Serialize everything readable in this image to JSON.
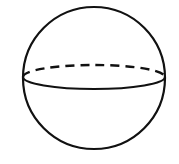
{
  "diagram": {
    "shape": "sphere",
    "stroke_color": "#111111",
    "background": "#ffffff",
    "outline": {
      "cx": 94,
      "cy": 78,
      "r": 71
    },
    "equator": {
      "cx": 94,
      "cy": 77,
      "rx": 71,
      "ry": 12,
      "front_style": "solid",
      "back_style": "dashed"
    }
  }
}
